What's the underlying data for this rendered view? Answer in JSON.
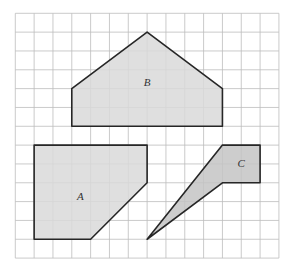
{
  "grid": {
    "columns": 14,
    "rows": 13,
    "origin_x": 15.3,
    "origin_y": 13.3,
    "cell": 18.83,
    "line_color": "#bdbdbd"
  },
  "shapes": [
    {
      "label": "A",
      "vertices": [
        [
          1,
          7
        ],
        [
          7,
          7
        ],
        [
          7,
          9
        ],
        [
          4,
          12
        ],
        [
          1,
          12
        ]
      ],
      "label_pos": [
        3.45,
        9.7
      ],
      "fill": "#d9d9d9",
      "stroke": "#262626"
    },
    {
      "label": "B",
      "vertices": [
        [
          7,
          1
        ],
        [
          11,
          4
        ],
        [
          11,
          6
        ],
        [
          3,
          6
        ],
        [
          3,
          4
        ]
      ],
      "label_pos": [
        7,
        3.65
      ],
      "fill": "#d9d9d9",
      "stroke": "#262626"
    },
    {
      "label": "C",
      "vertices": [
        [
          11,
          7
        ],
        [
          13,
          7
        ],
        [
          13,
          9
        ],
        [
          11,
          9
        ],
        [
          7,
          12
        ]
      ],
      "label_pos": [
        12.0,
        7.95
      ],
      "fill": "#c4c4c4",
      "stroke": "#262626"
    }
  ]
}
